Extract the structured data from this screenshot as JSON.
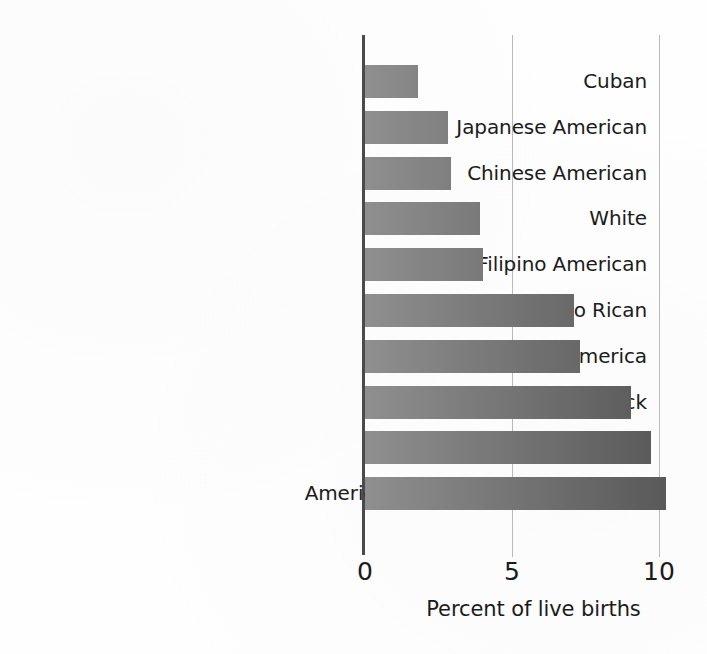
{
  "chart_data": {
    "type": "bar",
    "orientation": "horizontal",
    "title": "",
    "subtitle": "",
    "xlabel": "Percent of live births",
    "ylabel": "",
    "categories": [
      "Cuban",
      "Japanese American",
      "Chinese American",
      "White",
      "Filipino American",
      "Puerto Rican",
      "Central and South America",
      "Black",
      "Mexican American",
      "American Indian or Alaskan Native"
    ],
    "values": [
      1.8,
      2.8,
      2.9,
      3.9,
      4.0,
      7.1,
      7.3,
      9.0,
      9.7,
      10.2
    ],
    "xlim": [
      0,
      10.6
    ],
    "xticks": [
      0,
      5,
      10
    ],
    "xtick_labels": [
      "0",
      "5",
      "10"
    ],
    "grid": "vertical gridlines at 5 and 10",
    "legend": "none",
    "bar_fill_light": "#8f8f8f",
    "bar_fill_dark": "#595959",
    "axis_color": "#4a4a4a",
    "gridline_color": "#b9b9b9",
    "background": "#fefefe"
  },
  "axis": {
    "x_title": "Percent of live births",
    "tick_0": "0",
    "tick_5": "5",
    "tick_10": "10"
  }
}
